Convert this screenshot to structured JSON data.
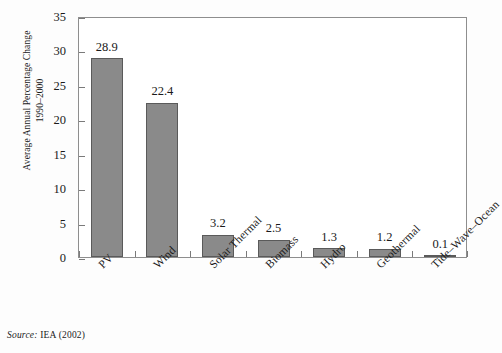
{
  "figure": {
    "source_note_label": "Source:",
    "source_note_text": "IEA (2002)"
  },
  "chart_data": {
    "type": "bar",
    "title": "",
    "subtitle": "",
    "xlabel": "",
    "ylabel": "Average Annual Percentage Change\n1990–2000",
    "categories": [
      "PV",
      "Wind",
      "Solar Thermal",
      "Biomass",
      "Hydro",
      "Geothermal",
      "Tide–Wave–Ocean"
    ],
    "values": [
      28.9,
      22.4,
      3.2,
      2.5,
      1.3,
      1.2,
      0.1
    ],
    "value_labels": [
      "28.9",
      "22.4",
      "3.2",
      "2.5",
      "1.3",
      "1.2",
      "0.1"
    ],
    "ylim": [
      0,
      35
    ],
    "yticks": [
      0,
      5,
      10,
      15,
      20,
      25,
      30,
      35
    ],
    "ytick_labels": [
      "0",
      "5",
      "10",
      "15",
      "20",
      "25",
      "30",
      "35"
    ],
    "grid": false,
    "legend": null,
    "bar_color": "#8a8a8a",
    "bar_edge_color": "#5a5a5a",
    "frame_color": "#8e8e8e",
    "background_color": "#ffffff"
  }
}
